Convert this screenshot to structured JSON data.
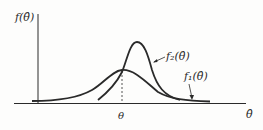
{
  "figure": {
    "y_axis_label": "f(θ̂)",
    "x_axis_label": "θ̂",
    "true_value_label": "θ",
    "curves": [
      {
        "name": "f1",
        "label": "f₁(θ̂)",
        "description": "wider, lower distribution centered at θ"
      },
      {
        "name": "f2",
        "label": "f₂(θ̂)",
        "description": "narrower, taller distribution shifted right of θ"
      }
    ],
    "colors": {
      "ink": "#2a2a2a",
      "background": "#fdfdfc"
    }
  }
}
